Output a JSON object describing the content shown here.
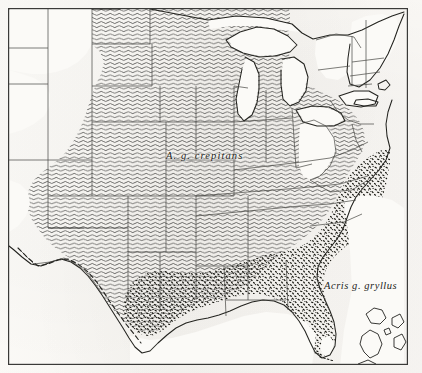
{
  "figure": {
    "type": "distribution-map",
    "region": "Eastern United States",
    "background_color": "#fbfaf7",
    "ink_color": "#1d1d1b",
    "frame": {
      "x": 8,
      "y": 8,
      "width": 400,
      "height": 357
    }
  },
  "labels": {
    "crepitans": "A.  g.  crepitans",
    "gryllus": "Acris g. gryllus"
  },
  "legend_patterns": [
    {
      "name": "wavy-hatch",
      "taxon": "A. g. crepitans",
      "description": "horizontal wavy line hatching",
      "color": "#2c2c2a"
    },
    {
      "name": "stipple-hatch",
      "taxon": "Acris g. gryllus",
      "description": "dense stipple / short dash fill",
      "color": "#15150f"
    }
  ],
  "map_features": {
    "coastline_color": "#23231f",
    "state_border_color": "#4a4a46",
    "international_border_style": "dashed",
    "great_lakes": [
      "Lake Superior",
      "Lake Michigan",
      "Lake Huron",
      "Lake Erie",
      "Lake Ontario"
    ],
    "unshaded_areas": [
      "Appalachian highlands",
      "northern Great Lakes",
      "New England",
      "western plains",
      "southern Florida tip"
    ]
  }
}
